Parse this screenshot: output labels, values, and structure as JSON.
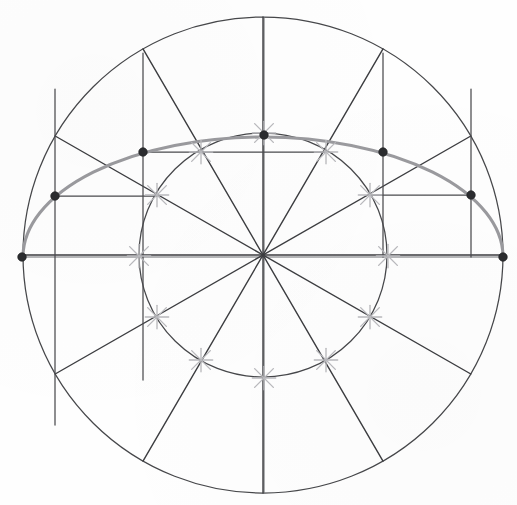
{
  "figure": {
    "type": "geometric-construction",
    "background_color": "#fefefe",
    "canvas": {
      "width": 517,
      "height": 505
    }
  },
  "chart_data": {
    "type": "scatter",
    "subtitle": "Two concentric circles, twelve radial lines at 30 degree spacing, ordinates and abscissae locating points on the ellipse",
    "xlabel": "",
    "ylabel": "",
    "xlim": [
      22,
      503
    ],
    "ylim": [
      15,
      492
    ],
    "grid": false,
    "legend": "none",
    "center": {
      "x": 263,
      "y": 255,
      "label": "O"
    },
    "circles": [
      {
        "name": "outer-circle",
        "cx": 263,
        "cy": 255,
        "r": 240,
        "ry": 238,
        "color": "#46474a",
        "role": "major-axis-circle"
      },
      {
        "name": "inner-circle",
        "cx": 263,
        "cy": 255,
        "r": 124,
        "ry": 122,
        "color": "#46474a",
        "role": "minor-axis-circle"
      }
    ],
    "radial_angles_deg": [
      0,
      30,
      60,
      90,
      120,
      150,
      180,
      210,
      240,
      270,
      300,
      330
    ],
    "radial_line_count": 12,
    "ellipse": {
      "name": "constructed-ellipse",
      "cx": 263,
      "cy": 255,
      "rx": 240,
      "ry": 120,
      "color": "#9a9a9e",
      "arc_span_deg": [
        0,
        180
      ],
      "drawn_portion": "upper-half"
    },
    "marked_points": [
      {
        "label": "P0",
        "angle_deg": 0,
        "x": 503,
        "y": 257
      },
      {
        "label": "P30",
        "angle_deg": 30,
        "x": 471,
        "y": 195
      },
      {
        "label": "P60",
        "angle_deg": 60,
        "x": 383,
        "y": 152
      },
      {
        "label": "P90",
        "angle_deg": 90,
        "x": 264,
        "y": 135
      },
      {
        "label": "P120",
        "angle_deg": 120,
        "x": 143,
        "y": 152
      },
      {
        "label": "P150",
        "angle_deg": 150,
        "x": 55,
        "y": 196
      },
      {
        "label": "P180",
        "angle_deg": 180,
        "x": 22,
        "y": 257
      }
    ],
    "ordinates": [
      {
        "from_angle_deg": 30,
        "x": 471,
        "y_top": 89,
        "y_bottom": 257
      },
      {
        "from_angle_deg": 60,
        "x": 383,
        "y_top": 53,
        "y_bottom": 257
      },
      {
        "from_angle_deg": 120,
        "x": 143,
        "y_top": 53,
        "y_bottom": 380
      },
      {
        "from_angle_deg": 150,
        "x": 55,
        "y_top": 89,
        "y_bottom": 425
      }
    ],
    "abscissae": [
      {
        "from_angle_deg": 30,
        "y": 195,
        "x_left": 370,
        "x_right": 471
      },
      {
        "from_angle_deg": 60,
        "y": 152,
        "x_left": 143,
        "x_right": 326
      },
      {
        "from_angle_deg": 150,
        "y": 196,
        "x_left": 55,
        "x_right": 157
      }
    ],
    "tick_crosses": [
      {
        "angle_deg": 0,
        "x": 388,
        "y": 256
      },
      {
        "angle_deg": 30,
        "x": 370,
        "y": 195
      },
      {
        "angle_deg": 60,
        "x": 326,
        "y": 152
      },
      {
        "angle_deg": 90,
        "x": 264,
        "y": 133
      },
      {
        "angle_deg": 120,
        "x": 201,
        "y": 152
      },
      {
        "angle_deg": 150,
        "x": 157,
        "y": 195
      },
      {
        "angle_deg": 180,
        "x": 139,
        "y": 256
      },
      {
        "angle_deg": 210,
        "x": 157,
        "y": 317
      },
      {
        "angle_deg": 240,
        "x": 201,
        "y": 360
      },
      {
        "angle_deg": 270,
        "x": 264,
        "y": 378
      },
      {
        "angle_deg": 300,
        "x": 326,
        "y": 360
      },
      {
        "angle_deg": 330,
        "x": 370,
        "y": 317
      }
    ],
    "colors": {
      "construction_line": "#4a4b4e",
      "radial_line": "#3c3d40",
      "circle_outline": "#46474a",
      "ellipse_curve": "#9a9a9e",
      "tick_cross": "#b9b9bd",
      "point_marker": "#2b2c2f",
      "axis_line": "#6d6e72",
      "background": "#fefefe"
    }
  }
}
